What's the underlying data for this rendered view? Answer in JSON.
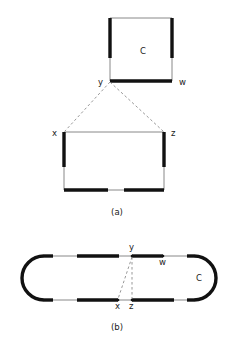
{
  "figure": {
    "title_caption_a": "(a)",
    "title_caption_b": "(b)",
    "colors": {
      "thick_edge": "#111111",
      "thin_edge": "#7a7a7a",
      "dashed_chord": "#8d8d8d",
      "background": "#ffffff",
      "label_text": "#1a1a1a"
    }
  },
  "panel_a": {
    "caption": "(a)",
    "cycle_label": "C",
    "vertices": [
      {
        "id": "y",
        "label": "y",
        "x": 110,
        "y": 81,
        "label_x": 98,
        "label_y": 85
      },
      {
        "id": "w",
        "label": "w",
        "x": 172,
        "y": 81,
        "label_x": 179,
        "label_y": 85
      },
      {
        "id": "x",
        "label": "x",
        "x": 64,
        "y": 132,
        "label_x": 52,
        "label_y": 136
      },
      {
        "id": "z",
        "label": "z",
        "x": 164,
        "y": 132,
        "label_x": 171,
        "label_y": 136
      }
    ],
    "upper_square": {
      "left": 110,
      "right": 172,
      "top": 18,
      "bottom": 81,
      "thick_left_fraction": 0.64,
      "thick_right_fraction": 0.64,
      "bottom_thick": true,
      "top_thick": false
    },
    "lower_square": {
      "left": 64,
      "right": 164,
      "top": 132,
      "bottom": 190,
      "thick_left_fraction": 0.6,
      "thick_right_fraction": 0.6,
      "top_thick": false,
      "bottom_thick_segments": [
        [
          0.0,
          0.44
        ],
        [
          0.6,
          1.0
        ]
      ]
    },
    "chords": [
      {
        "from": "y",
        "to": "x",
        "style": "dashed"
      },
      {
        "from": "y",
        "to": "z",
        "style": "dashed"
      }
    ]
  },
  "panel_b": {
    "caption": "(b)",
    "cycle_label": "C",
    "shape": "stadium",
    "geometry": {
      "left": 22,
      "right": 216,
      "top": 256,
      "bottom": 300,
      "radius": 22
    },
    "vertices": [
      {
        "id": "y",
        "label": "y",
        "x": 132,
        "y": 256,
        "label_x": 129,
        "label_y": 250
      },
      {
        "id": "w",
        "label": "w",
        "x": 163,
        "y": 256,
        "label_x": 159,
        "label_y": 265
      },
      {
        "id": "x",
        "label": "x",
        "x": 118,
        "y": 300,
        "label_x": 115,
        "label_y": 309
      },
      {
        "id": "z",
        "label": "z",
        "x": 132,
        "y": 300,
        "label_x": 129,
        "label_y": 309
      }
    ],
    "top_thick_segments": [
      [
        0.0,
        0.06
      ],
      [
        0.22,
        0.5
      ],
      [
        0.565,
        0.72
      ],
      [
        0.955,
        1.0
      ]
    ],
    "bottom_thick_segments": [
      [
        0.0,
        0.06
      ],
      [
        0.22,
        0.495
      ],
      [
        0.565,
        0.84
      ],
      [
        0.955,
        1.0
      ]
    ],
    "left_arc_thick": true,
    "right_arc_thick": true,
    "chords": [
      {
        "from": "y",
        "to": "x",
        "style": "dashed"
      },
      {
        "from": "y",
        "to": "z",
        "style": "dashed"
      }
    ]
  }
}
